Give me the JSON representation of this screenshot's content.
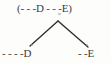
{
  "diagram": {
    "type": "tree",
    "background_color": "#fdfdfb",
    "text_color": "#3b3b3b",
    "line_color": "#2e2e2e",
    "root": {
      "label": "(- - -D - - -E)",
      "open_paren": "(",
      "close_paren": ")",
      "left_dashes": "- - -",
      "left_symbol": "D",
      "middle_dashes": "- - -",
      "right_symbol": "E"
    },
    "children": [
      {
        "label": "- - - -D",
        "dashes": "- - - -",
        "symbol": "D",
        "position": "left"
      },
      {
        "label": "- -E",
        "dashes": "- -",
        "symbol": "E",
        "position": "right"
      }
    ],
    "edges": [
      {
        "name": "left-branch",
        "from": [
          58,
          21
        ],
        "to": [
          30,
          46
        ]
      },
      {
        "name": "right-branch",
        "from": [
          58,
          21
        ],
        "to": [
          88,
          47
        ]
      }
    ]
  }
}
